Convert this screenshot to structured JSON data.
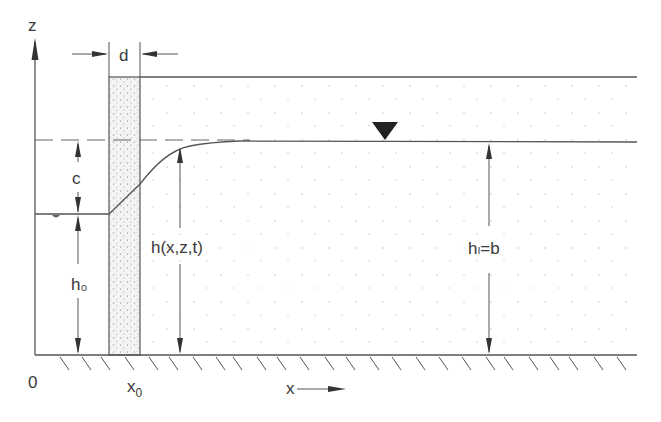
{
  "diagram": {
    "labels": {
      "z_axis": "z",
      "width_d": "d",
      "rise_c": "c",
      "head_left": "h₀",
      "head_profile": "h(x,z,t)",
      "head_right": "hₗ=b",
      "origin": "0",
      "barrier_x": "x",
      "barrier_x_sub": "0",
      "x_axis": "x"
    },
    "colors": {
      "line": "#555555",
      "text": "#3a3a3a",
      "stipple_fill": "#f2f2f2",
      "marker": "#222222",
      "background": "#ffffff"
    },
    "geometry": {
      "ground_y": 355,
      "axis_x": 35,
      "barrier_left": 109,
      "barrier_right": 140,
      "top_y": 77,
      "dashed_y": 140,
      "water_right_y": 142,
      "water_left_y": 214,
      "right_end_x": 637
    }
  }
}
